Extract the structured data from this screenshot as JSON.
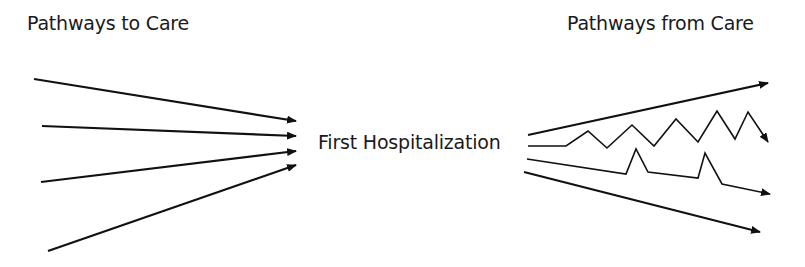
{
  "labels": {
    "pathways_to_care": "Pathways to Care",
    "pathways_from_care": "Pathways from Care",
    "center": "First Hospitalization"
  },
  "colors": {
    "stroke": "#111111",
    "text": "#1a1a1a",
    "background": "#ffffff"
  },
  "incoming_arrows": [
    {
      "from": [
        34,
        79
      ],
      "to": [
        296,
        121
      ]
    },
    {
      "from": [
        42,
        126
      ],
      "to": [
        296,
        136
      ]
    },
    {
      "from": [
        41,
        182
      ],
      "to": [
        296,
        151
      ]
    },
    {
      "from": [
        48,
        251
      ],
      "to": [
        296,
        165
      ]
    }
  ],
  "outgoing_paths": [
    {
      "name": "rising-pathway",
      "points": [
        [
          528,
          135
        ],
        [
          768,
          83
        ]
      ]
    },
    {
      "name": "zigzag-pathway",
      "points": [
        [
          528,
          146
        ],
        [
          566,
          146
        ],
        [
          588,
          131
        ],
        [
          607,
          148
        ],
        [
          632,
          125
        ],
        [
          654,
          146
        ],
        [
          676,
          119
        ],
        [
          698,
          142
        ],
        [
          717,
          111
        ],
        [
          735,
          139
        ],
        [
          748,
          112
        ],
        [
          768,
          142
        ]
      ]
    },
    {
      "name": "spiked-pathway",
      "points": [
        [
          527,
          159
        ],
        [
          626,
          174
        ],
        [
          636,
          149
        ],
        [
          648,
          172
        ],
        [
          698,
          178
        ],
        [
          705,
          153
        ],
        [
          722,
          184
        ],
        [
          770,
          194
        ]
      ]
    },
    {
      "name": "declining-pathway",
      "points": [
        [
          524,
          172
        ],
        [
          760,
          232
        ]
      ]
    }
  ]
}
